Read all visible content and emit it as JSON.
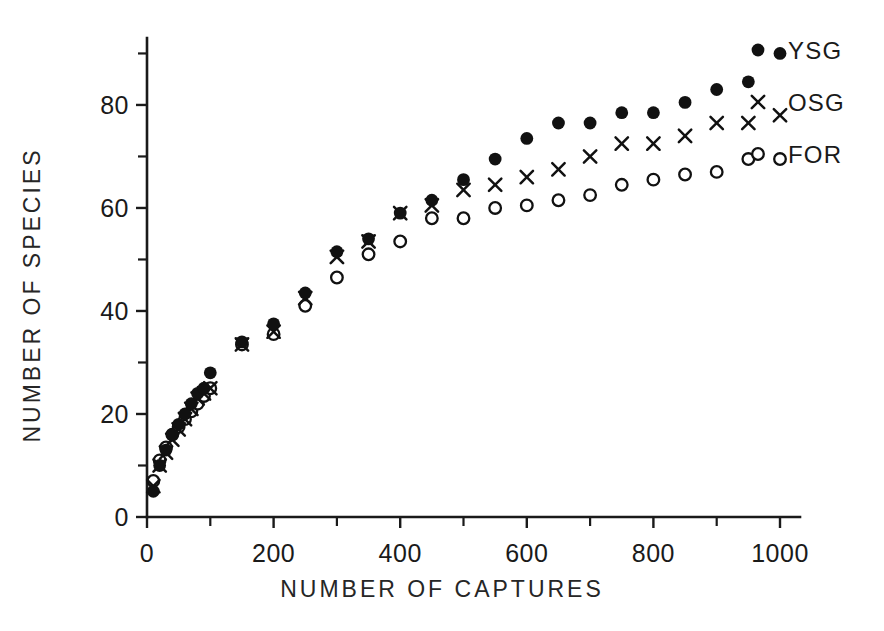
{
  "chart_data": {
    "type": "scatter",
    "title": "",
    "xlabel": "NUMBER OF CAPTURES",
    "ylabel": "NUMBER OF SPECIES",
    "xlim": [
      0,
      1020
    ],
    "ylim": [
      0,
      93
    ],
    "grid": false,
    "legend_position": "top-right",
    "x_ticks_major": [
      0,
      200,
      400,
      600,
      800,
      1000
    ],
    "x_ticks_minor": [
      100,
      300,
      500,
      700,
      900
    ],
    "y_ticks_major": [
      0,
      20,
      40,
      60,
      80
    ],
    "y_ticks_minor": [
      10,
      30,
      50,
      70,
      90
    ],
    "x_tick_labels": [
      "0",
      "200",
      "400",
      "600",
      "800",
      "1000"
    ],
    "y_tick_labels": [
      "0",
      "20",
      "40",
      "60",
      "80"
    ],
    "series": [
      {
        "name": "YSG",
        "marker": "filled-circle",
        "color": "#111111",
        "x": [
          10,
          20,
          30,
          40,
          50,
          60,
          70,
          80,
          90,
          100,
          150,
          200,
          250,
          300,
          350,
          400,
          450,
          500,
          550,
          600,
          650,
          700,
          750,
          800,
          850,
          900,
          950,
          1000
        ],
        "y": [
          5,
          10,
          13,
          16,
          18,
          20,
          22,
          24,
          25,
          28,
          34,
          37.5,
          43.5,
          51.5,
          54,
          59,
          61.5,
          65.5,
          69.5,
          73.5,
          76.5,
          76.5,
          78.5,
          78.5,
          80.5,
          83,
          84.5,
          90
        ]
      },
      {
        "name": "OSG",
        "marker": "cross",
        "color": "#111111",
        "x": [
          10,
          20,
          30,
          40,
          50,
          60,
          70,
          80,
          90,
          100,
          150,
          200,
          250,
          300,
          350,
          400,
          450,
          500,
          550,
          600,
          650,
          700,
          750,
          800,
          850,
          900,
          950,
          1000
        ],
        "y": [
          6,
          10,
          12.5,
          15,
          17,
          19,
          21,
          23,
          24,
          25,
          33.5,
          36,
          42.5,
          50.5,
          53.5,
          59,
          60.5,
          63.5,
          64.5,
          66,
          67.5,
          70,
          72.5,
          72.5,
          74,
          76.5,
          76.5,
          78
        ]
      },
      {
        "name": "FOR",
        "marker": "open-circle",
        "color": "#111111",
        "x": [
          10,
          20,
          30,
          40,
          50,
          60,
          70,
          80,
          90,
          100,
          150,
          200,
          250,
          300,
          350,
          400,
          450,
          500,
          550,
          600,
          650,
          700,
          750,
          800,
          850,
          900,
          950,
          1000
        ],
        "y": [
          7,
          11,
          13.5,
          16,
          17.5,
          19,
          20.5,
          22,
          23.5,
          25,
          33.5,
          35.5,
          41,
          46.5,
          51,
          53.5,
          58,
          58,
          60,
          60.5,
          61.5,
          62.5,
          64.5,
          65.5,
          66.5,
          67,
          69.5,
          69.5
        ]
      }
    ],
    "legend": [
      {
        "label": "YSG",
        "marker": "filled-circle"
      },
      {
        "label": "OSG",
        "marker": "cross"
      },
      {
        "label": "FOR",
        "marker": "open-circle"
      }
    ]
  }
}
